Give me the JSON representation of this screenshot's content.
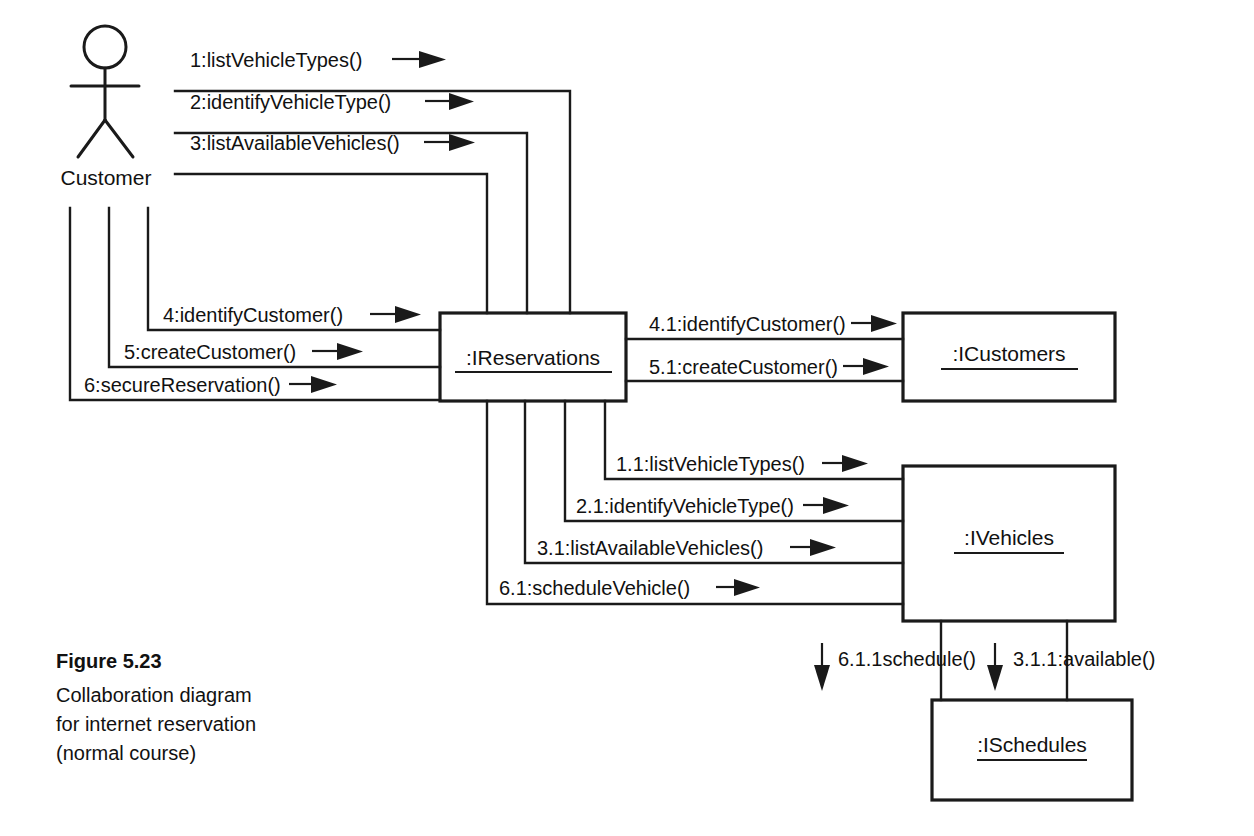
{
  "figure": {
    "title": "Figure 5.23",
    "caption_lines": [
      "Collaboration diagram",
      "for internet reservation",
      "(normal course)"
    ]
  },
  "actor": {
    "name": "Customer",
    "icon": "stick-figure-actor-icon"
  },
  "objects": [
    {
      "id": "reservations",
      "label": ":IReservations"
    },
    {
      "id": "customers",
      "label": ":ICustomers"
    },
    {
      "id": "vehicles",
      "label": ":IVehicles"
    },
    {
      "id": "schedules",
      "label": ":ISchedules"
    }
  ],
  "messages": [
    {
      "id": "m1",
      "label": "1:listVehicleTypes()",
      "from": "Customer",
      "to": ":IReservations"
    },
    {
      "id": "m2",
      "label": "2:identifyVehicleType()",
      "from": "Customer",
      "to": ":IReservations"
    },
    {
      "id": "m3",
      "label": "3:listAvailableVehicles()",
      "from": "Customer",
      "to": ":IReservations"
    },
    {
      "id": "m4",
      "label": "4:identifyCustomer()",
      "from": "Customer",
      "to": ":IReservations"
    },
    {
      "id": "m5",
      "label": "5:createCustomer()",
      "from": "Customer",
      "to": ":IReservations"
    },
    {
      "id": "m6",
      "label": "6:secureReservation()",
      "from": "Customer",
      "to": ":IReservations"
    },
    {
      "id": "m41",
      "label": "4.1:identifyCustomer()",
      "from": ":IReservations",
      "to": ":ICustomers"
    },
    {
      "id": "m51",
      "label": "5.1:createCustomer()",
      "from": ":IReservations",
      "to": ":ICustomers"
    },
    {
      "id": "m11",
      "label": "1.1:listVehicleTypes()",
      "from": ":IReservations",
      "to": ":IVehicles"
    },
    {
      "id": "m21",
      "label": "2.1:identifyVehicleType()",
      "from": ":IReservations",
      "to": ":IVehicles"
    },
    {
      "id": "m31",
      "label": "3.1:listAvailableVehicles()",
      "from": ":IReservations",
      "to": ":IVehicles"
    },
    {
      "id": "m61",
      "label": "6.1:scheduleVehicle()",
      "from": ":IReservations",
      "to": ":IVehicles"
    },
    {
      "id": "m611",
      "label": "6.1.1schedule()",
      "from": ":IVehicles",
      "to": ":ISchedules"
    },
    {
      "id": "m311",
      "label": "3.1.1:available()",
      "from": ":IVehicles",
      "to": ":ISchedules"
    }
  ],
  "colors": {
    "ink": "#1a1a1a",
    "background": "#ffffff"
  }
}
